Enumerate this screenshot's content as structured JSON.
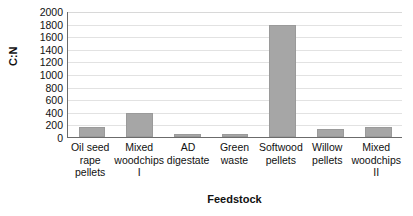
{
  "chart_data": {
    "type": "bar",
    "title": "",
    "xlabel": "Feedstock",
    "ylabel": "C:N",
    "categories": [
      "Oil seed rape pellets",
      "Mixed woodchips I",
      "AD digestate",
      "Green waste",
      "Softwood pellets",
      "Willow pellets",
      "Mixed woodchips II"
    ],
    "values": [
      160,
      380,
      40,
      45,
      1780,
      120,
      165
    ],
    "ylim": [
      0,
      2000
    ],
    "ytick_step": 200,
    "yticks": [
      "2000",
      "1800",
      "1600",
      "1400",
      "1200",
      "1000",
      "800",
      "600",
      "400",
      "200",
      "0"
    ],
    "grid": true,
    "legend": false,
    "bar_color": "#a6a6a6",
    "gridline_color": "#e2e2e2",
    "axis_color": "#6b6b6b"
  }
}
